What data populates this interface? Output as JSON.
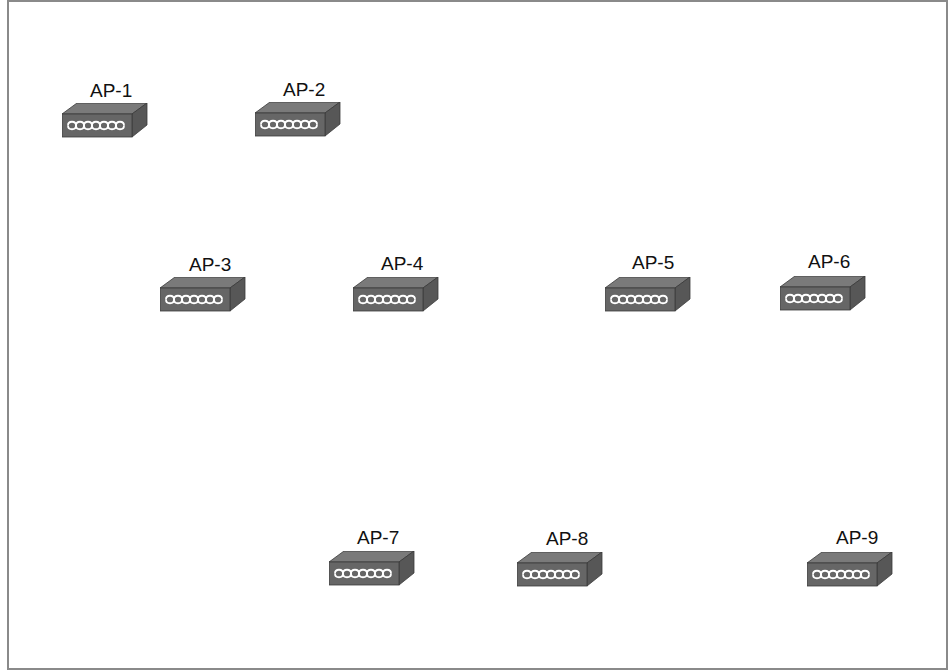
{
  "diagram": {
    "type": "network-placement",
    "device_kind": "wireless-access-point",
    "colors": {
      "border": "#8a8a8a",
      "top_face": "#7a7a7a",
      "front_face": "#666666",
      "side_face": "#575757",
      "antenna_pattern": "#ffffff"
    },
    "devices": [
      {
        "id": "ap1",
        "label": "AP-1",
        "x": 62,
        "y": 114,
        "label_x": 90,
        "label_y": 80
      },
      {
        "id": "ap2",
        "label": "AP-2",
        "x": 255,
        "y": 113,
        "label_x": 283,
        "label_y": 79
      },
      {
        "id": "ap3",
        "label": "AP-3",
        "x": 160,
        "y": 288,
        "label_x": 189,
        "label_y": 254
      },
      {
        "id": "ap4",
        "label": "AP-4",
        "x": 353,
        "y": 288,
        "label_x": 381,
        "label_y": 253
      },
      {
        "id": "ap5",
        "label": "AP-5",
        "x": 605,
        "y": 288,
        "label_x": 632,
        "label_y": 252
      },
      {
        "id": "ap6",
        "label": "AP-6",
        "x": 780,
        "y": 287,
        "label_x": 808,
        "label_y": 251
      },
      {
        "id": "ap7",
        "label": "AP-7",
        "x": 329,
        "y": 562,
        "label_x": 357,
        "label_y": 527
      },
      {
        "id": "ap8",
        "label": "AP-8",
        "x": 517,
        "y": 563,
        "label_x": 546,
        "label_y": 528
      },
      {
        "id": "ap9",
        "label": "AP-9",
        "x": 807,
        "y": 563,
        "label_x": 836,
        "label_y": 527
      }
    ]
  }
}
